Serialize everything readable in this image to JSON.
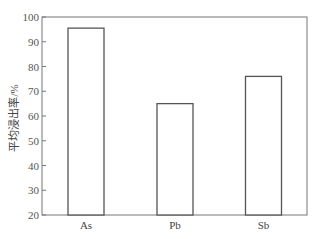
{
  "chart_data": {
    "type": "bar",
    "title": "",
    "xlabel": "",
    "ylabel": "平均浸出率/%",
    "categories": [
      "As",
      "Pb",
      "Sb"
    ],
    "values": [
      95.5,
      65,
      76
    ],
    "ylim": [
      20,
      100
    ],
    "yticks": [
      20,
      30,
      40,
      50,
      60,
      70,
      80,
      90,
      100
    ],
    "grid": false,
    "legend": null,
    "bar_style": {
      "fill": "#ffffff",
      "stroke": "#555555"
    }
  }
}
